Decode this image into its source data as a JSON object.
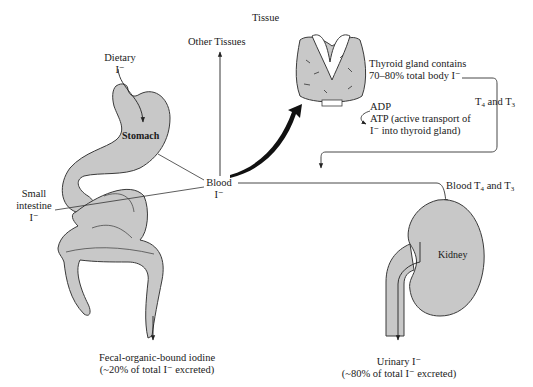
{
  "diagram": {
    "type": "iodine-metabolism-flow",
    "colors": {
      "organ_fill": "#c8c8c8",
      "organ_stroke": "#3a3a3a",
      "line": "#333333",
      "thick_arrow": "#111111",
      "background": "#ffffff"
    },
    "labels": {
      "tissue": "Tissue",
      "other_tissues": "Other Tissues",
      "dietary_line1": "Dietary",
      "dietary_line2": "I⁻",
      "stomach": "Stomach",
      "small_intestine_line1": "Small",
      "small_intestine_line2": "intestine",
      "small_intestine_line3": "I⁻",
      "blood_line1": "Blood",
      "blood_line2": "I⁻",
      "thyroid_line1": "Thyroid gland contains",
      "thyroid_line2": "70–80% total body I⁻",
      "adp": "ADP",
      "atp_line1": "ATP (active transport of",
      "atp_line2": "I⁻ into thyroid gland)",
      "t4_t3_T": "T",
      "t4_sub": "4",
      "t4_t3_and": " and T",
      "t3_sub": "3",
      "blood_t4_t3_prefix": "Blood T",
      "kidney": "Kidney",
      "fecal_line1": "Fecal-organic-bound iodine",
      "fecal_line2": "(~20% of total I⁻ excreted)",
      "urinary_line1": "Urinary I⁻",
      "urinary_line2": "(~80% of total I⁻ excreted)"
    }
  }
}
